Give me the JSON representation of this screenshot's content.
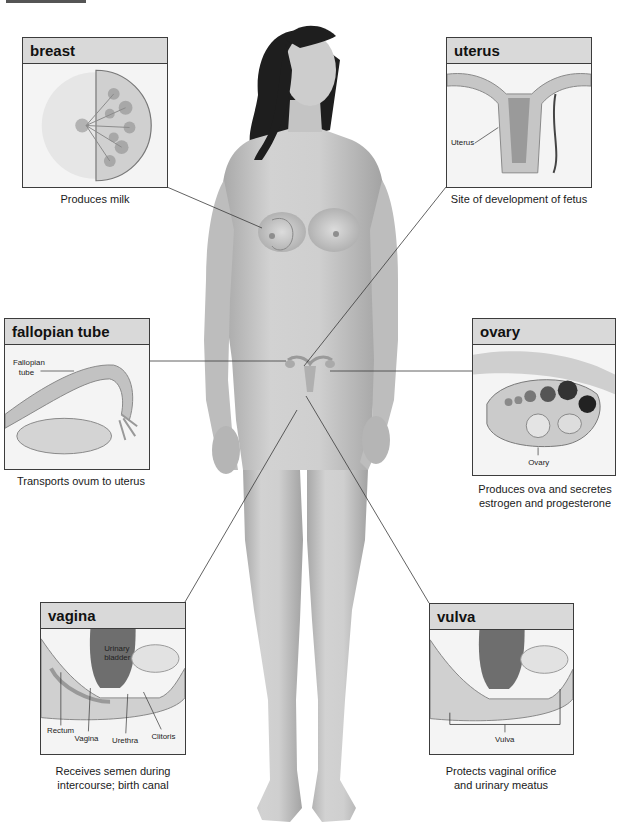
{
  "figure": {
    "colors": {
      "panel_border": "#3c3c3c",
      "panel_header_bg": "#d9d9d9",
      "skin": "#c9c9c9",
      "hair": "#1e1e1e",
      "leader_line": "#3a3a3a"
    }
  },
  "panels": {
    "breast": {
      "title": "breast",
      "caption": "Produces milk",
      "labels": []
    },
    "uterus": {
      "title": "uterus",
      "caption": "Site of development of fetus",
      "labels": [
        "Uterus"
      ]
    },
    "fallopian_tube": {
      "title": "fallopian tube",
      "caption": "Transports ovum to uterus",
      "labels": [
        "Fallopian",
        "tube"
      ]
    },
    "ovary": {
      "title": "ovary",
      "caption_line1": "Produces ova and secretes",
      "caption_line2": "estrogen and progesterone",
      "labels": [
        "Ovary"
      ]
    },
    "vagina": {
      "title": "vagina",
      "caption_line1": "Receives semen during",
      "caption_line2": "intercourse; birth canal",
      "labels": [
        "Urinary",
        "bladder",
        "Rectum",
        "Vagina",
        "Urethra",
        "Clitoris"
      ]
    },
    "vulva": {
      "title": "vulva",
      "caption_line1": "Protects vaginal orifice",
      "caption_line2": "and urinary meatus",
      "labels": [
        "Vulva"
      ]
    }
  }
}
